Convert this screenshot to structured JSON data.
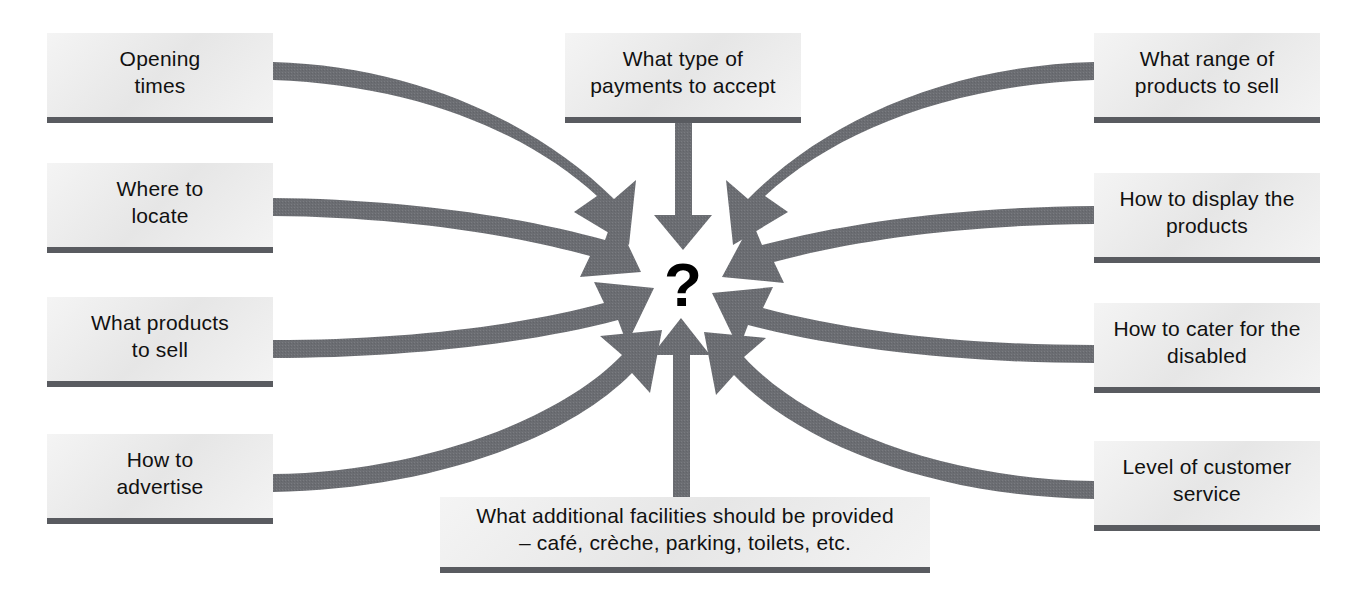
{
  "diagram": {
    "type": "converging-arrow-concept-map",
    "center_symbol": "?",
    "colors": {
      "arrow": "#6b6d72",
      "node_fill": "#e7e7e7",
      "node_underline": "#595b60",
      "text": "#111111",
      "background": "#ffffff"
    },
    "nodes": [
      {
        "id": "opening-times",
        "label": "Opening\ntimes",
        "side": "left",
        "position": {
          "x": 47,
          "y": 33,
          "w": 226,
          "h": 90
        }
      },
      {
        "id": "where-to-locate",
        "label": "Where to\nlocate",
        "side": "left",
        "position": {
          "x": 47,
          "y": 163,
          "w": 226,
          "h": 90
        }
      },
      {
        "id": "what-products-to-sell",
        "label": "What products\nto sell",
        "side": "left",
        "position": {
          "x": 47,
          "y": 297,
          "w": 226,
          "h": 90
        }
      },
      {
        "id": "how-to-advertise",
        "label": "How to\nadvertise",
        "side": "left",
        "position": {
          "x": 47,
          "y": 434,
          "w": 226,
          "h": 90
        }
      },
      {
        "id": "what-type-of-payments-to-accept",
        "label": "What type of\npayments to accept",
        "side": "top",
        "position": {
          "x": 565,
          "y": 33,
          "w": 236,
          "h": 90
        }
      },
      {
        "id": "what-additional-facilities",
        "label": "What additional facilities should be provided\n– café, crèche, parking, toilets, etc.",
        "side": "bottom",
        "position": {
          "x": 440,
          "y": 497,
          "w": 490,
          "h": 76
        }
      },
      {
        "id": "what-range-of-products-to-sell",
        "label": "What range of\nproducts to sell",
        "side": "right",
        "position": {
          "x": 1094,
          "y": 33,
          "w": 226,
          "h": 90
        }
      },
      {
        "id": "how-to-display-the-products",
        "label": "How to display the\nproducts",
        "side": "right",
        "position": {
          "x": 1094,
          "y": 173,
          "w": 226,
          "h": 90
        }
      },
      {
        "id": "how-to-cater-for-the-disabled",
        "label": "How to cater for the\ndisabled",
        "side": "right",
        "position": {
          "x": 1094,
          "y": 303,
          "w": 226,
          "h": 90
        }
      },
      {
        "id": "level-of-customer-service",
        "label": "Level of customer\nservice",
        "side": "right",
        "position": {
          "x": 1094,
          "y": 441,
          "w": 226,
          "h": 90
        }
      }
    ],
    "arrows": [
      {
        "id": "arrow-opening-times",
        "from": "opening-times",
        "to": "center"
      },
      {
        "id": "arrow-where-to-locate",
        "from": "where-to-locate",
        "to": "center"
      },
      {
        "id": "arrow-what-products-to-sell",
        "from": "what-products-to-sell",
        "to": "center"
      },
      {
        "id": "arrow-how-to-advertise",
        "from": "how-to-advertise",
        "to": "center"
      },
      {
        "id": "arrow-payments",
        "from": "what-type-of-payments-to-accept",
        "to": "center"
      },
      {
        "id": "arrow-additional-facilities",
        "from": "what-additional-facilities",
        "to": "center"
      },
      {
        "id": "arrow-range-of-products",
        "from": "what-range-of-products-to-sell",
        "to": "center"
      },
      {
        "id": "arrow-display-products",
        "from": "how-to-display-the-products",
        "to": "center"
      },
      {
        "id": "arrow-cater-disabled",
        "from": "how-to-cater-for-the-disabled",
        "to": "center"
      },
      {
        "id": "arrow-customer-service",
        "from": "level-of-customer-service",
        "to": "center"
      }
    ]
  }
}
